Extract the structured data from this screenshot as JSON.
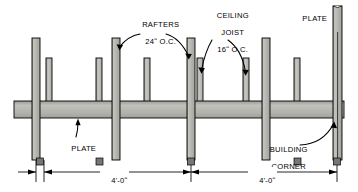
{
  "diagram": {
    "colors": {
      "member_fill": "#b3b3ae",
      "member_fill_light": "#c9c9c4",
      "member_outline": "#000000",
      "background": "#ffffff",
      "leader": "#000000"
    },
    "labels": {
      "rafters": "RAFTERS",
      "rafters_spacing": "24ʺ O.C.",
      "ceiling": "CEILING",
      "joist": "JOIST",
      "joist_spacing": "16ʺ O.C.",
      "plate_top": "PLATE",
      "plate_bottom": "PLATE",
      "building": "BUILDING",
      "corner": "CORNER"
    },
    "dimensions": [
      {
        "id": "span-left",
        "text": "4'-0ʺ"
      },
      {
        "id": "span-right",
        "text": "4'-0ʺ"
      }
    ],
    "members": {
      "rafters": [
        {
          "id": "rafter-1",
          "x": 32
        },
        {
          "id": "rafter-2",
          "x": 112
        },
        {
          "id": "rafter-3",
          "x": 187
        },
        {
          "id": "rafter-4",
          "x": 262
        },
        {
          "id": "rafter-corner",
          "x": 335
        }
      ],
      "ceiling_joists": [
        {
          "id": "joist-1",
          "x": 46
        },
        {
          "id": "joist-2",
          "x": 96
        },
        {
          "id": "joist-3",
          "x": 144
        },
        {
          "id": "joist-4",
          "x": 197
        },
        {
          "id": "joist-5",
          "x": 243
        },
        {
          "id": "joist-6",
          "x": 294
        }
      ],
      "plate": {
        "id": "top-plate",
        "y": 101,
        "height": 17
      }
    }
  }
}
